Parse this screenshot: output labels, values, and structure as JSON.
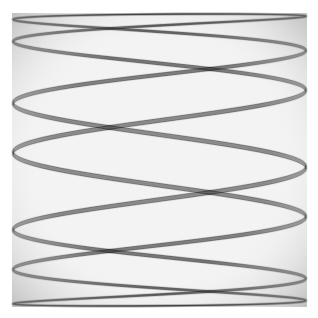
{
  "image": {
    "width": 318,
    "height": 318,
    "background": "#ffffff",
    "subject": "Lissajous harmonograph pattern of interwoven curved ribbons forming a diamond lattice",
    "frame": {
      "x": 12,
      "y": 13,
      "width": 295,
      "height": 294
    },
    "fill_tint": "#f1f1f1",
    "ink_color": "#000000"
  },
  "pattern": {
    "freq_x": 7,
    "freq_y": 1,
    "ribbon_strands": 9,
    "ribbon_phase_spread": 0.09,
    "base_phase": 0.35,
    "strand_opacity": 0.16,
    "edge_opacity": 0.45,
    "stroke_width": 0.8
  }
}
